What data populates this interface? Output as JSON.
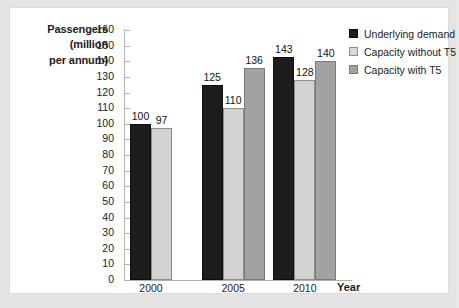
{
  "chart_data": {
    "type": "bar",
    "title": "",
    "subtitle": "",
    "xlabel": "Year",
    "ylabel": "Passengers (million per annum)",
    "ylabel_lines": [
      "Passengers",
      "(million",
      "per annum)"
    ],
    "categories": [
      "2000",
      "2005",
      "2010"
    ],
    "ylim": [
      0,
      160
    ],
    "ytick_step": 10,
    "yticks": [
      "160",
      "150",
      "140",
      "130",
      "120",
      "110",
      "100",
      "90",
      "80",
      "70",
      "60",
      "50",
      "40",
      "30",
      "20",
      "10",
      "0"
    ],
    "grid": false,
    "legend_position": "top-right",
    "series": [
      {
        "name": "Underlying demand",
        "color": "#1d1d1d",
        "values": [
          100,
          125,
          143
        ],
        "labels": [
          "100",
          "125",
          "143"
        ]
      },
      {
        "name": "Capacity without T5",
        "color": "#d2d2d2",
        "values": [
          97,
          110,
          128
        ],
        "labels": [
          "97",
          "110",
          "128"
        ]
      },
      {
        "name": "Capacity with T5",
        "color": "#a2a2a2",
        "values": [
          null,
          136,
          140
        ],
        "labels": [
          "",
          "136",
          "140"
        ]
      }
    ]
  },
  "legend": {
    "items": [
      {
        "label": "Underlying demand"
      },
      {
        "label": "Capacity without T5"
      },
      {
        "label": "Capacity with T5"
      }
    ]
  }
}
